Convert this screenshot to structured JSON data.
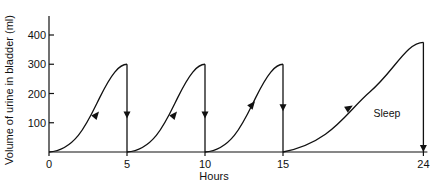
{
  "chart_data": {
    "type": "line",
    "title": "",
    "xlabel": "Hours",
    "ylabel": "Volume of urine in bladder (ml)",
    "xlim": [
      0,
      24
    ],
    "ylim": [
      0,
      450
    ],
    "grid": false,
    "x_ticks": [
      0,
      5,
      10,
      15,
      24
    ],
    "x_tick_labels": [
      "0",
      "5",
      "10",
      "15",
      "24"
    ],
    "y_ticks": [
      100,
      200,
      300,
      400
    ],
    "y_tick_labels": [
      "100",
      "200",
      "300",
      "400"
    ],
    "cycles": [
      {
        "name": "Cycle 1",
        "start": 0,
        "end": 5,
        "peak": 300,
        "fill_arrow_x": 3.0,
        "fill_arrow_y": 125,
        "void_arrow_y": 125
      },
      {
        "name": "Cycle 2",
        "start": 5,
        "end": 10,
        "peak": 300,
        "fill_arrow_x": 8.0,
        "fill_arrow_y": 125,
        "void_arrow_y": 125
      },
      {
        "name": "Cycle 3",
        "start": 10,
        "end": 15,
        "peak": 300,
        "fill_arrow_x": 13.0,
        "fill_arrow_y": 160,
        "void_arrow_y": 150
      },
      {
        "name": "Sleep",
        "start": 15,
        "end": 24,
        "peak": 375,
        "fill_arrow_x": 19.2,
        "fill_arrow_y": 150,
        "void_arrow_y": 0
      }
    ],
    "annotations": [
      {
        "text": "Sleep",
        "x": 20.8,
        "y": 120
      }
    ]
  }
}
